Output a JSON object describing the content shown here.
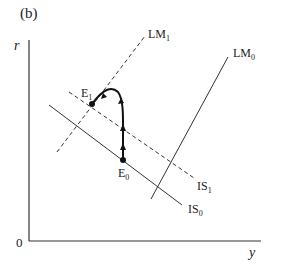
{
  "panel_label": "(b)",
  "axes": {
    "y_axis_label": "r",
    "x_axis_label": "y",
    "origin_label": "0"
  },
  "curves": {
    "lm1": {
      "name": "LM",
      "sub": "1",
      "style": "dashed"
    },
    "lm0": {
      "name": "LM",
      "sub": "0",
      "style": "solid"
    },
    "is1": {
      "name": "IS",
      "sub": "1",
      "style": "dashed"
    },
    "is0": {
      "name": "IS",
      "sub": "0",
      "style": "solid"
    }
  },
  "points": {
    "e1": {
      "name": "E",
      "sub": "1"
    },
    "e0": {
      "name": "E",
      "sub": "0"
    }
  },
  "colors": {
    "line": "#222222",
    "background": "#ffffff"
  }
}
